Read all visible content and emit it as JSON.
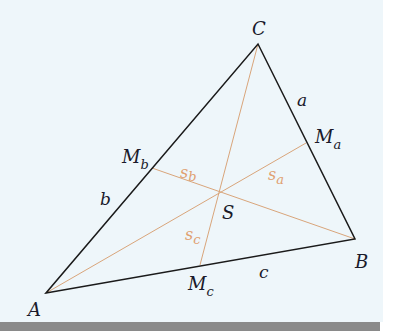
{
  "diagram": {
    "type": "triangle-medians",
    "vertices": {
      "A": {
        "label": "A",
        "x": 46,
        "y": 293
      },
      "B": {
        "label": "B",
        "x": 355,
        "y": 239
      },
      "C": {
        "label": "C",
        "x": 258,
        "y": 44
      }
    },
    "midpoints": {
      "Ma": {
        "label": "M",
        "sub": "a",
        "x": 306,
        "y": 143
      },
      "Mb": {
        "label": "M",
        "sub": "b",
        "x": 152,
        "y": 168
      },
      "Mc": {
        "label": "M",
        "sub": "c",
        "x": 200,
        "y": 265
      }
    },
    "centroid": {
      "label": "S",
      "x": 219,
      "y": 192
    },
    "sides": {
      "a": {
        "label": "a"
      },
      "b": {
        "label": "b"
      },
      "c": {
        "label": "c"
      }
    },
    "medians": {
      "sa": {
        "label": "s",
        "sub": "a"
      },
      "sb": {
        "label": "s",
        "sub": "b"
      },
      "sc": {
        "label": "s",
        "sub": "c"
      }
    },
    "colors": {
      "background": "#eef6fa",
      "triangle": "#1a1a1a",
      "median": "#d9a57a",
      "label": "#1a1a2a",
      "median_label": "#e0a070",
      "bottom_bar": "#8a8a8a"
    }
  }
}
